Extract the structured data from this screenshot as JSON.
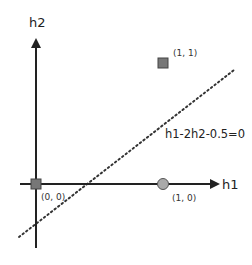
{
  "diagram": {
    "axes": {
      "x_label": "h1",
      "y_label": "h2"
    },
    "points": [
      {
        "label": "(0, 0)",
        "shape": "square",
        "color": "#777777"
      },
      {
        "label": "(1, 1)",
        "shape": "square",
        "color": "#777777"
      },
      {
        "label": "(1, 0)",
        "shape": "circle",
        "color": "#aaaaaa"
      }
    ],
    "decision_boundary": {
      "equation": "h1-2h2-0.5=0",
      "style": "dotted"
    },
    "colors": {
      "axis": "#222222",
      "marker_stroke": "#444444",
      "line": "#333333"
    }
  }
}
